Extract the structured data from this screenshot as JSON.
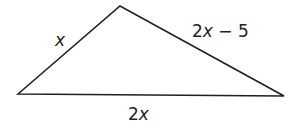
{
  "figure": {
    "type": "triangle",
    "vertices": {
      "left": [
        18,
        94
      ],
      "top": [
        120,
        6
      ],
      "right": [
        284,
        96
      ]
    },
    "stroke_color": "#231f20",
    "labels": {
      "left_side": {
        "coef": "",
        "var": "x",
        "rest": ""
      },
      "right_side": {
        "coef": "2",
        "var": "x",
        "rest": " − 5"
      },
      "base": {
        "coef": "2",
        "var": "x",
        "rest": ""
      }
    },
    "label_text": {
      "left_side": "x",
      "right_side": "2x − 5",
      "base": "2x"
    }
  }
}
